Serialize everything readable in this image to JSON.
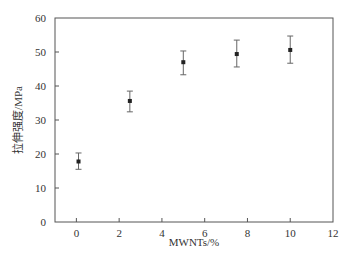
{
  "chart_data": {
    "type": "scatter",
    "title": "",
    "xlabel": "MWNTs/%",
    "ylabel": "拉伸强度/MPa",
    "xlim": [
      -1,
      12
    ],
    "ylim": [
      0,
      60
    ],
    "xticks": [
      0,
      2,
      4,
      6,
      8,
      10,
      12
    ],
    "yticks": [
      0,
      10,
      20,
      30,
      40,
      50,
      60
    ],
    "grid": false,
    "legend": null,
    "series": [
      {
        "name": "拉伸强度",
        "marker": "square",
        "color": "#222222",
        "x": [
          0.1,
          2.5,
          5,
          7.5,
          10
        ],
        "y": [
          17.8,
          35.6,
          47.0,
          49.4,
          50.6
        ],
        "err_upper": [
          20.3,
          38.5,
          50.3,
          53.5,
          54.7
        ],
        "err_lower": [
          15.5,
          32.4,
          43.3,
          45.6,
          46.7
        ]
      }
    ]
  }
}
